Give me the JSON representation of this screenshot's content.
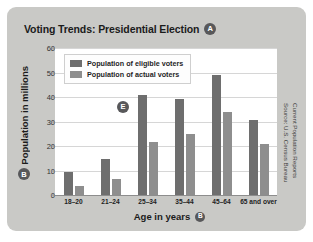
{
  "figure": {
    "title": "Voting Trends: Presidential Election",
    "title_marker": "A",
    "xaxis_marker": "B",
    "yaxis_marker": "B",
    "plot_marker": "E",
    "source_line1": "Source: U.S. Census Bureau",
    "source_line2": "Current Population Reports",
    "colors": {
      "panel": "#c9c9c6",
      "plot_background": "#ffffff",
      "eligible_bar": "#6e6e6e",
      "actual_bar": "#8e8e8e",
      "gridline": "#d6d6d6",
      "marker": "#58585a"
    }
  },
  "chart_data": {
    "type": "bar",
    "title": "Voting Trends: Presidential Election",
    "xlabel": "Age in years",
    "ylabel": "Population in millions",
    "categories": [
      "18–20",
      "21–24",
      "25–34",
      "35–44",
      "45–64",
      "65 and over"
    ],
    "series": [
      {
        "name": "Population of eligible voters",
        "values": [
          9.5,
          14.5,
          41,
          39,
          49,
          30.5
        ]
      },
      {
        "name": "Population of actual voters",
        "values": [
          3.5,
          6.5,
          21.5,
          25,
          34,
          21
        ]
      }
    ],
    "ylim": [
      0,
      60
    ],
    "yticks": [
      0,
      10,
      20,
      30,
      40,
      50,
      60
    ],
    "ytick_labels": [
      "0",
      "10",
      "20",
      "30",
      "40",
      "50",
      "60"
    ],
    "grid": true,
    "legend_position": "upper-left-inside"
  }
}
